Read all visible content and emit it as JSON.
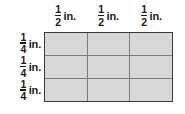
{
  "figure": {
    "grid": {
      "rows": 3,
      "columns": 3,
      "fill_color": "#d8d8d8",
      "inner_line_color": "#7d7d7d",
      "outer_border_color": "#3a3a3a",
      "background_color": "#ffffff"
    },
    "column_labels": [
      {
        "numerator": "1",
        "denominator": "2",
        "unit": "in."
      },
      {
        "numerator": "1",
        "denominator": "2",
        "unit": "in."
      },
      {
        "numerator": "1",
        "denominator": "2",
        "unit": "in."
      }
    ],
    "row_labels": [
      {
        "numerator": "1",
        "denominator": "4",
        "unit": "in."
      },
      {
        "numerator": "1",
        "denominator": "4",
        "unit": "in."
      },
      {
        "numerator": "1",
        "denominator": "4",
        "unit": "in."
      }
    ]
  }
}
